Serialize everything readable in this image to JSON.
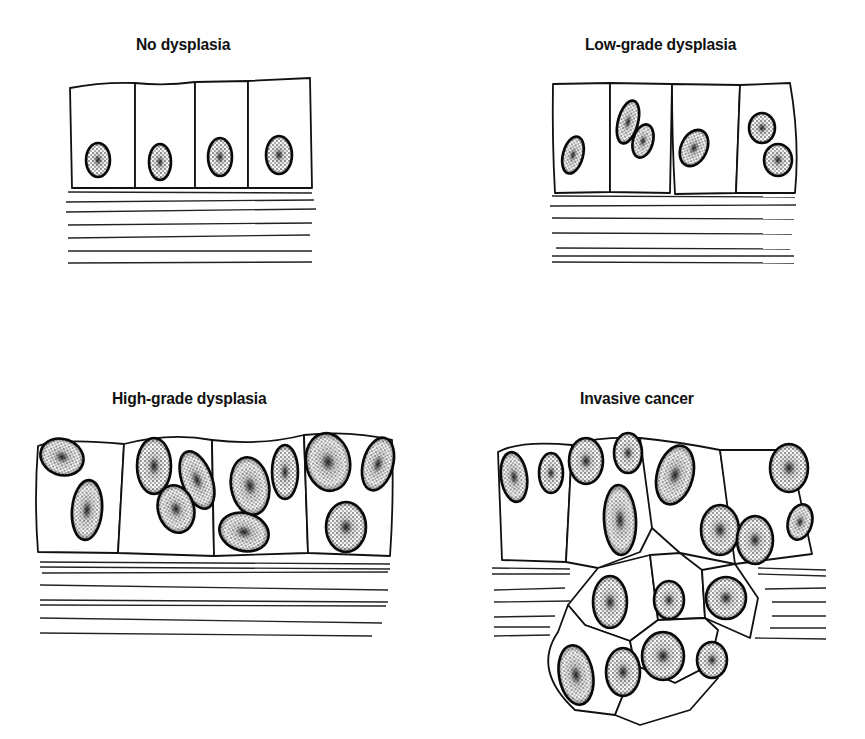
{
  "figure": {
    "type": "diagram",
    "panels": [
      {
        "id": "no-dysplasia",
        "title": "No dysplasia",
        "cells": 4,
        "nuclei": 4
      },
      {
        "id": "low-grade",
        "title": "Low-grade dysplasia",
        "cells": 4,
        "nuclei": 6
      },
      {
        "id": "high-grade",
        "title": "High-grade dysplasia",
        "cells": 4,
        "nuclei": 10
      },
      {
        "id": "invasive",
        "title": "Invasive cancer",
        "cells": 10,
        "nuclei": 16
      }
    ]
  },
  "colors": {
    "ink": "#111111",
    "background": "#ffffff",
    "nucleus_fill": "#d9d9d9"
  }
}
